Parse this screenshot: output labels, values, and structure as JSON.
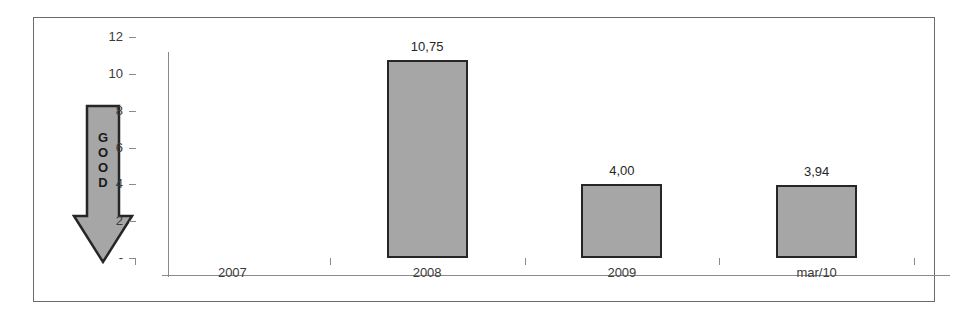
{
  "chart_data": {
    "type": "bar",
    "title": "",
    "subtitle": "",
    "xlabel": "",
    "ylabel": "",
    "categories": [
      "2007",
      "2008",
      "2009",
      "mar/10"
    ],
    "values": [
      null,
      10.75,
      4.0,
      3.94
    ],
    "data_labels": [
      "",
      "10,75",
      "4,00",
      "3,94"
    ],
    "ylim": [
      0,
      12
    ],
    "yticks": [
      0,
      2,
      4,
      6,
      8,
      10,
      12
    ],
    "ytick_labels": [
      "-",
      "2",
      "4",
      "6",
      "8",
      "10",
      "12"
    ],
    "grid": false,
    "legend": false,
    "decimal_separator": ",",
    "series": [
      {
        "name": "",
        "values": [
          null,
          10.75,
          4.0,
          3.94
        ]
      }
    ],
    "annotations": [
      {
        "name": "good-direction-arrow",
        "text": "GOOD",
        "letters": [
          "G",
          "O",
          "O",
          "D"
        ],
        "direction": "down",
        "position": "left-of-y-axis"
      }
    ],
    "colors": {
      "bar_fill": "#a6a6a6",
      "bar_border": "#262626",
      "axis": "#8a8a8a",
      "text": "#3a3a3a",
      "frame": "#6b6b6b",
      "background": "#ffffff",
      "arrow_fill": "#a6a6a6",
      "arrow_border": "#262626"
    }
  }
}
